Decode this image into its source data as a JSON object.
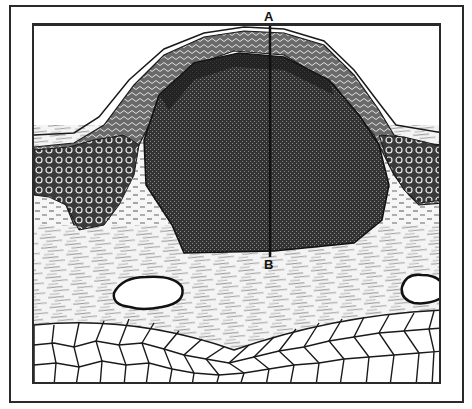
{
  "figure": {
    "type": "histological cross-section illustration",
    "labels": {
      "top": "A",
      "bottom": "B"
    },
    "measurement_line": "A–B vertical depth line through lesion",
    "structures": [
      "epidermis (stratified cell layer)",
      "dark pigmented nodular lesion",
      "dermis (fibrous connective tissue)",
      "blood vessels (two open lumens)",
      "subcutaneous fat (adipocyte polygon layer)"
    ],
    "colors": {
      "ink": "#1a1a1a",
      "lesion": "#2b2b2b",
      "paper": "#ffffff"
    }
  }
}
